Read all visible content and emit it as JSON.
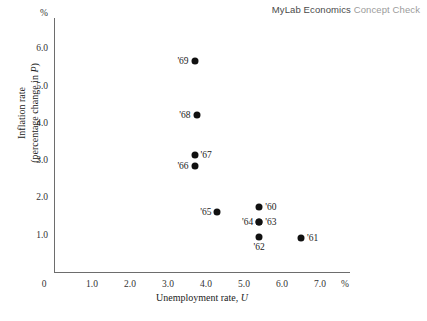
{
  "header": {
    "brand": "MyLab Economics",
    "sub": "Concept Check"
  },
  "chart_data": {
    "type": "scatter",
    "title": "",
    "xlabel": "Unemployment rate, U",
    "ylabel": "Inflation rate (percentage change in P)",
    "ylabel_line1": "Inflation rate",
    "ylabel_line2": "(percentage change in P)",
    "x_unit": "%",
    "y_unit": "%",
    "xlim": [
      0,
      7.8
    ],
    "ylim": [
      0,
      6.85
    ],
    "grid": false,
    "legend": "none",
    "xticks": [
      "0",
      "1.0",
      "2.0",
      "3.0",
      "4.0",
      "5.0",
      "6.0",
      "7.0"
    ],
    "xtick_values": [
      0,
      1,
      2,
      3,
      4,
      5,
      6,
      7
    ],
    "yticks": [
      "1.0",
      "2.0",
      "3.0",
      "4.0",
      "5.0",
      "6.0"
    ],
    "ytick_values": [
      1,
      2,
      3,
      4,
      5,
      6
    ],
    "points": [
      {
        "label": "'60",
        "x": 5.4,
        "y": 1.75,
        "label_pos": "right"
      },
      {
        "label": "'61",
        "x": 6.5,
        "y": 0.9,
        "label_pos": "right"
      },
      {
        "label": "'62",
        "x": 5.4,
        "y": 0.95,
        "label_pos": "below"
      },
      {
        "label": "'63",
        "x": 5.4,
        "y": 1.35,
        "label_pos": "right"
      },
      {
        "label": "'64",
        "x": 5.4,
        "y": 1.35,
        "label_pos": "left"
      },
      {
        "label": "'65",
        "x": 4.3,
        "y": 1.6,
        "label_pos": "left"
      },
      {
        "label": "'66",
        "x": 3.7,
        "y": 2.85,
        "label_pos": "left"
      },
      {
        "label": "'67",
        "x": 3.7,
        "y": 3.15,
        "label_pos": "right"
      },
      {
        "label": "'68",
        "x": 3.75,
        "y": 4.2,
        "label_pos": "left"
      },
      {
        "label": "'69",
        "x": 3.7,
        "y": 5.65,
        "label_pos": "left"
      }
    ],
    "marker_color": "#111111",
    "axis_color": "#6d6d6d"
  }
}
